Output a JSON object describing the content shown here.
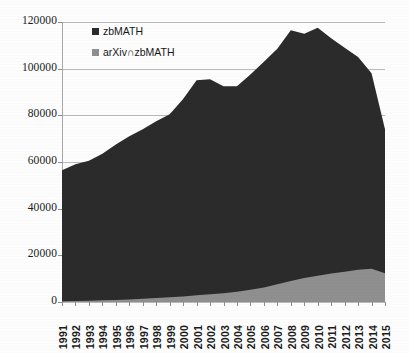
{
  "chart_data": {
    "type": "area",
    "title": "",
    "subtitle": "",
    "xlabel": "",
    "ylabel": "",
    "stacked": true,
    "grid": true,
    "legend_position": "top-left",
    "xlim": [
      1991,
      2015
    ],
    "ylim": [
      0,
      120000
    ],
    "ytick_values": [
      0,
      20000,
      40000,
      60000,
      80000,
      100000,
      120000
    ],
    "ytick_labels": [
      "0",
      "20000",
      "40000",
      "60000",
      "80000",
      "100000",
      "120000"
    ],
    "categories": [
      1991,
      1992,
      1993,
      1994,
      1995,
      1996,
      1997,
      1998,
      1999,
      2000,
      2001,
      2002,
      2003,
      2004,
      2005,
      2006,
      2007,
      2008,
      2009,
      2010,
      2011,
      2012,
      2013,
      2014,
      2015
    ],
    "xtick_labels": [
      "1991",
      "1992",
      "1993",
      "1994",
      "1995",
      "1996",
      "1997",
      "1998",
      "1999",
      "2000",
      "2001",
      "2002",
      "2003",
      "2004",
      "2005",
      "2006",
      "2007",
      "2008",
      "2009",
      "2010",
      "2011",
      "2012",
      "2013",
      "2014",
      "2015"
    ],
    "series": [
      {
        "name": "zbMATH",
        "color": "#2b2b2b",
        "values": [
          56500,
          59000,
          60500,
          63500,
          67500,
          71000,
          74000,
          77500,
          80500,
          87000,
          95000,
          95500,
          92500,
          92500,
          97500,
          103000,
          108500,
          116500,
          115000,
          117500,
          113000,
          109000,
          105000,
          98000,
          74000
        ]
      },
      {
        "name": "arXiv∩zbMATH",
        "color": "#8f8f8f",
        "values": [
          300,
          400,
          500,
          700,
          900,
          1100,
          1400,
          1700,
          2000,
          2400,
          2900,
          3300,
          3800,
          4400,
          5200,
          6200,
          7600,
          9000,
          10300,
          11300,
          12200,
          13000,
          13800,
          14300,
          12300
        ]
      }
    ]
  },
  "legend": {
    "items": [
      {
        "label": "zbMATH",
        "color": "#2b2b2b"
      },
      {
        "label": "arXiv∩zbMATH",
        "color": "#8f8f8f"
      }
    ]
  }
}
